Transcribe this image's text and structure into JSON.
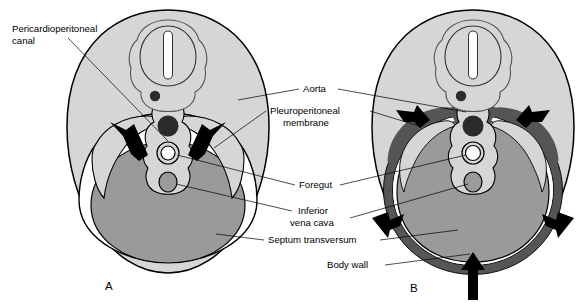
{
  "figure": {
    "background_color": "#ffffff",
    "panels": [
      {
        "letter": "A",
        "letter_pos": [
          105,
          288
        ],
        "description": "Earlier stage: wide pericardioperitoneal canals flanking the foregut; pleuroperitoneal membranes beginning to grow; large septum transversum below."
      },
      {
        "letter": "B",
        "letter_pos": [
          410,
          290
        ],
        "description": "Later stage: pleuroperitoneal membranes have enlarged into a thick ring fusing with the body wall; canals narrowed; arrows show continued ingrowth."
      }
    ],
    "labels": [
      {
        "id": "pericardioperitoneal-canal",
        "text": "Pericardioperitoneal\ncanal",
        "lines": [
          "Pericardioperitoneal",
          "canal"
        ],
        "text_x": 12,
        "text_y": 32,
        "align": "start",
        "leader": "M 68 38 L 168 141"
      },
      {
        "id": "aorta",
        "text": "Aorta",
        "lines": [
          "Aorta"
        ],
        "text_x": 303,
        "text_y": 92,
        "align": "start",
        "leader": "M 299 89 L 236 99 M 338 89 L 466 110"
      },
      {
        "id": "pleuroperitoneal-membrane",
        "text": "Pleuroperitoneal\nmembrane",
        "lines": [
          "Pleuroperitoneal",
          "membrane"
        ],
        "text_x": 270,
        "text_y": 114,
        "align": "start",
        "leader": "M 266 111 L 216 147 M 370 111 L 417 122"
      },
      {
        "id": "foregut",
        "text": "Foregut",
        "lines": [
          "Foregut"
        ],
        "text_x": 299,
        "text_y": 188,
        "align": "start",
        "leader": "M 295 185 L 178 153 M 340 185 L 466 152"
      },
      {
        "id": "inferior-vena-cava",
        "text": "Inferior\nvena cava",
        "lines": [
          "Inferior",
          "vena cava"
        ],
        "text_x": 296,
        "text_y": 214,
        "align": "start",
        "leader": "M 292 211 L 173 182 M 348 218 L 470 180"
      },
      {
        "id": "septum-transversum",
        "text": "Septum transversum",
        "lines": [
          "Septum transversum"
        ],
        "text_x": 268,
        "text_y": 243,
        "align": "start",
        "leader": "M 264 240 L 218 232 M 380 240 L 460 228"
      },
      {
        "id": "body-wall",
        "text": "Body wall",
        "lines": [
          "Body wall"
        ],
        "text_x": 327,
        "text_y": 268,
        "align": "start",
        "leader": "M 385 265 L 472 252"
      }
    ],
    "colors": {
      "body_wall_fill": "#d6d6d6",
      "septum_fill": "#9a9a9a",
      "membrane_dark": "#555555",
      "aorta_fill": "#2b2b2b",
      "canal_white": "#ffffff",
      "outline": "#000000",
      "inner_outline": "#4a4a4a",
      "arrow_fill": "#000000"
    },
    "structures": [
      {
        "name": "neural-tube",
        "panels": [
          "A",
          "B"
        ]
      },
      {
        "name": "neural-tube-lumen",
        "panels": [
          "A",
          "B"
        ]
      },
      {
        "name": "notochord",
        "panels": [
          "A",
          "B"
        ]
      },
      {
        "name": "aorta",
        "panels": [
          "A",
          "B"
        ]
      },
      {
        "name": "foregut",
        "panels": [
          "A",
          "B"
        ]
      },
      {
        "name": "inferior-vena-cava",
        "panels": [
          "A",
          "B"
        ]
      },
      {
        "name": "pericardioperitoneal-canal",
        "panels": [
          "A",
          "B"
        ]
      },
      {
        "name": "pleuroperitoneal-membrane",
        "panels": [
          "A",
          "B"
        ]
      },
      {
        "name": "septum-transversum",
        "panels": [
          "A",
          "B"
        ]
      },
      {
        "name": "body-wall",
        "panels": [
          "A",
          "B"
        ]
      },
      {
        "name": "growth-arrow",
        "panels": [
          "A",
          "B"
        ]
      }
    ]
  }
}
